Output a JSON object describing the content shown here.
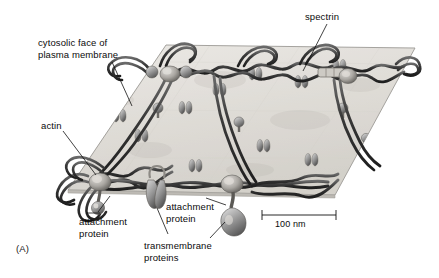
{
  "figure": {
    "panel_label": "(A)",
    "background_color": "#ffffff",
    "membrane_color": "#e2dfda",
    "filament_color": "#3b3b3b",
    "protein_color": "#9c9c9c",
    "label_color": "#0b0b0b"
  },
  "labels": {
    "cytosolic_face": "cytosolic face of\nplasma membrane",
    "spectrin": "spectrin",
    "actin": "actin",
    "attachment_protein_left": "attachment\nprotein",
    "attachment_protein_right": "attachment\nprotein",
    "transmembrane_proteins": "transmembrane\nproteins"
  },
  "scale_bar": {
    "value": "100 nm",
    "length_px": 74
  }
}
